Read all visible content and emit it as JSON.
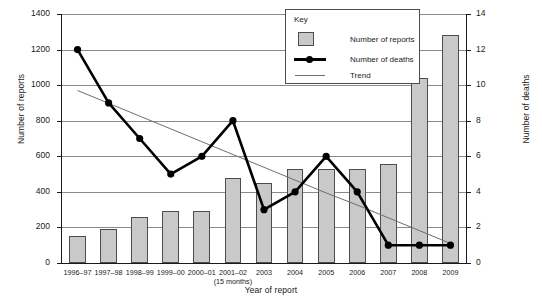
{
  "chart_data": {
    "type": "bar",
    "title": "",
    "xlabel": "Year of report",
    "ylabel": "Number of reports",
    "ylabel_secondary": "Number of deaths",
    "grid": true,
    "legend_position": "top-right",
    "categories": [
      "1996–97",
      "1997–98",
      "1998–99",
      "1999–00",
      "2000–01",
      "2001–02",
      "2003",
      "2004",
      "2005",
      "2006",
      "2007",
      "2008",
      "2009"
    ],
    "category_sublabels": [
      "",
      "",
      "",
      "",
      "",
      "(15 months)",
      "",
      "",
      "",
      "",
      "",
      "",
      ""
    ],
    "ylim": [
      0,
      1400
    ],
    "yticks": [
      0,
      200,
      400,
      600,
      800,
      1000,
      1200,
      1400
    ],
    "ylim_secondary": [
      0,
      14
    ],
    "yticks_secondary": [
      0,
      2,
      4,
      6,
      8,
      10,
      12,
      14
    ],
    "series": [
      {
        "name": "Number of reports",
        "type": "bar",
        "axis": "left",
        "color": "#c9c9c9",
        "edge_color": "#4d4d4d",
        "values": [
          150,
          190,
          260,
          295,
          290,
          480,
          450,
          530,
          530,
          530,
          555,
          1040,
          1280
        ]
      },
      {
        "name": "Number of deaths",
        "type": "line",
        "axis": "right",
        "color": "#000000",
        "marker": "circle",
        "values": [
          12,
          9,
          7,
          5,
          6,
          8,
          3,
          4,
          6,
          4,
          1,
          1,
          1
        ]
      },
      {
        "name": "Trend",
        "type": "line",
        "axis": "left",
        "color": "#6e6e6e",
        "marker": "none",
        "values": [
          970,
          898,
          826,
          754,
          682,
          610,
          538,
          466,
          394,
          326,
          254,
          182,
          110
        ]
      }
    ]
  },
  "legend": {
    "title": "Key",
    "items": [
      {
        "label": "Number of reports",
        "kind": "swatch"
      },
      {
        "label": "Number of deaths",
        "kind": "line-marker"
      },
      {
        "label": "Trend",
        "kind": "thin-line"
      }
    ]
  },
  "axes": {
    "left_title": "Number of reports",
    "right_title": "Number of deaths",
    "x_title": "Year of report"
  }
}
